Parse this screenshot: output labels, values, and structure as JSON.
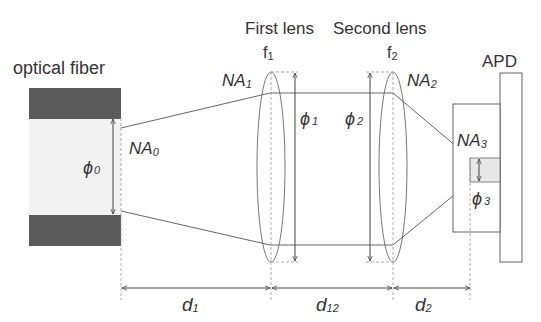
{
  "labels": {
    "fiber": "optical fiber",
    "lens1": "First lens",
    "lens2": "Second lens",
    "apd": "APD",
    "f1": "f",
    "f1_sub": "1",
    "f2": "f",
    "f2_sub": "2",
    "na0": "NA",
    "na0_sub": "0",
    "na1": "NA",
    "na1_sub": "1",
    "na2": "NA",
    "na2_sub": "2",
    "na3": "NA",
    "na3_sub": "3",
    "phi0": "ϕ",
    "phi0_sub": "0",
    "phi1": "ϕ",
    "phi1_sub": "1",
    "phi2": "ϕ",
    "phi2_sub": "2",
    "phi3": "ϕ",
    "phi3_sub": "3",
    "d1": "d",
    "d1_sub": "1",
    "d12": "d",
    "d12_sub": "12",
    "d2": "d",
    "d2_sub": "2"
  },
  "colors": {
    "cladding": "#5a5a5a",
    "core": "#f3f3f3",
    "line": "#555555",
    "detector": "#e8e8e8"
  }
}
